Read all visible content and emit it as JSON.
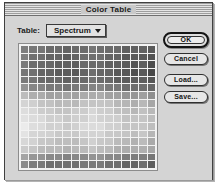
{
  "window": {
    "title": "Color Table"
  },
  "controls": {
    "table_label": "Table:",
    "table_popup_value": "Spectrum",
    "popup_arrow_icon": "chevron-down-icon"
  },
  "buttons": {
    "ok": "OK",
    "cancel": "Cancel",
    "load": "Load...",
    "save": "Save..."
  },
  "color_grid": {
    "columns": 16,
    "rows": 16,
    "description": "16x16 color table swatch grid (256 entries), rendered grayscale",
    "row_base_grays": [
      "#6f6f6f",
      "#6a6a6a",
      "#676767",
      "#646464",
      "#6b6b6b",
      "#7e7e7e",
      "#a8a8a8",
      "#c2c2c2",
      "#cdcdcd",
      "#d3d3d3",
      "#d6d6d6",
      "#d0d0d0",
      "#c6c6c6",
      "#bcbcbc",
      "#8e8e8e",
      "#767676"
    ],
    "column_shade_offsets": [
      6,
      3,
      1,
      -1,
      -2,
      -3,
      -2,
      0,
      2,
      1,
      -1,
      -3,
      -5,
      -6,
      -4,
      -8
    ]
  },
  "colors": {
    "window_face": "#d4d4d4",
    "title_stripe_dark": "#9d9d9d",
    "title_stripe_light": "#e4e4e4",
    "border": "#404040",
    "well_background": "#f2f2f2"
  }
}
